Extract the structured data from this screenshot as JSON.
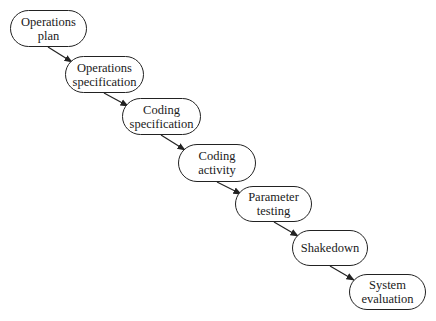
{
  "diagram": {
    "type": "waterfall",
    "nodes": [
      {
        "id": "n1",
        "label": "Operations plan",
        "lines": [
          "Operations",
          "plan"
        ],
        "x": 10,
        "y": 10,
        "w": 77,
        "h": 37
      },
      {
        "id": "n2",
        "label": "Operations specification",
        "lines": [
          "Operations",
          "specification"
        ],
        "x": 65,
        "y": 56,
        "w": 79,
        "h": 37
      },
      {
        "id": "n3",
        "label": "Coding specification",
        "lines": [
          "Coding",
          "specification"
        ],
        "x": 122,
        "y": 98,
        "w": 79,
        "h": 37
      },
      {
        "id": "n4",
        "label": "Coding activity",
        "lines": [
          "Coding",
          "activity"
        ],
        "x": 178,
        "y": 144,
        "w": 78,
        "h": 38
      },
      {
        "id": "n5",
        "label": "Parameter testing",
        "lines": [
          "Parameter",
          "testing"
        ],
        "x": 235,
        "y": 186,
        "w": 77,
        "h": 36
      },
      {
        "id": "n6",
        "label": "Shakedown",
        "lines": [
          "Shakedown"
        ],
        "x": 292,
        "y": 230,
        "w": 76,
        "h": 36
      },
      {
        "id": "n7",
        "label": "System evaluation",
        "lines": [
          "System",
          "evaluation"
        ],
        "x": 349,
        "y": 274,
        "w": 77,
        "h": 36
      }
    ],
    "edges": [
      {
        "from": "n1",
        "to": "n2",
        "x1": 48,
        "y1": 47,
        "x2": 72,
        "y2": 62
      },
      {
        "from": "n2",
        "to": "n3",
        "x1": 104,
        "y1": 93,
        "x2": 128,
        "y2": 106
      },
      {
        "from": "n3",
        "to": "n4",
        "x1": 161,
        "y1": 135,
        "x2": 185,
        "y2": 150
      },
      {
        "from": "n4",
        "to": "n5",
        "x1": 217,
        "y1": 182,
        "x2": 241,
        "y2": 194
      },
      {
        "from": "n5",
        "to": "n6",
        "x1": 274,
        "y1": 222,
        "x2": 298,
        "y2": 236
      },
      {
        "from": "n6",
        "to": "n7",
        "x1": 330,
        "y1": 266,
        "x2": 354,
        "y2": 280
      }
    ],
    "colors": {
      "stroke": "#222222",
      "text": "#1a1a1a",
      "background": "#ffffff"
    }
  }
}
